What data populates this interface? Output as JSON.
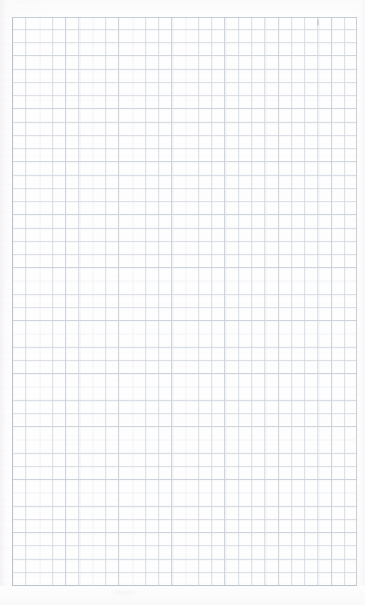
{
  "document": {
    "kind": "scanned-grid-paper",
    "title": "Blank grid paper sheet",
    "description": "A scanned blank sheet of squared / graph paper with no writing.",
    "page_width": 365,
    "page_height": 605,
    "has_text_content": "false",
    "visible_text": ""
  },
  "paper": {
    "background_color": "#fdfdfd",
    "surface_tint_color": "#fbfbfc",
    "bottom_margin_color": "#f9f9fa"
  },
  "grid": {
    "left": 12,
    "top": 17,
    "width": 345,
    "height": 569,
    "cell_width": 13.28,
    "cell_height": 13.24,
    "columns": 26,
    "rows": 43,
    "major_every": 4,
    "minor_line_color": "#cdd3db",
    "major_line_color": "#b0b9c4",
    "border_color": "#b3bcc7",
    "cell_fill_color": "#fefeff"
  },
  "artifacts": {
    "stray_mark_label": "faint pencil speck",
    "stray_smudge_label": "faint scan smudge",
    "scan_banding_label": "horizontal scanner banding",
    "edge_shadow_label": "scanner edge shading"
  }
}
